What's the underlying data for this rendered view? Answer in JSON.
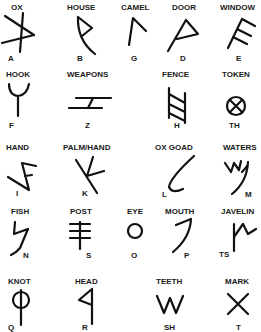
{
  "rows": [
    [
      {
        "meaning": "OX",
        "letter": "A"
      },
      {
        "meaning": "HOUSE",
        "letter": "B"
      },
      {
        "meaning": "CAMEL",
        "letter": "G"
      },
      {
        "meaning": "DOOR",
        "letter": "D"
      },
      {
        "meaning": "WINDOW",
        "letter": "E"
      }
    ],
    [
      {
        "meaning": "HOOK",
        "letter": "F"
      },
      {
        "meaning": "WEAPONS",
        "letter": "Z"
      },
      {
        "meaning": "FENCE",
        "letter": "H"
      },
      {
        "meaning": "TOKEN",
        "letter": "TH"
      }
    ],
    [
      {
        "meaning": "HAND",
        "letter": "I"
      },
      {
        "meaning": "PALM/HAND",
        "letter": "K"
      },
      {
        "meaning": "OX GOAD",
        "letter": "L"
      },
      {
        "meaning": "WATERS",
        "letter": "M"
      }
    ],
    [
      {
        "meaning": "FISH",
        "letter": "N"
      },
      {
        "meaning": "POST",
        "letter": "S"
      },
      {
        "meaning": "EYE",
        "letter": "O"
      },
      {
        "meaning": "MOUTH",
        "letter": "P"
      },
      {
        "meaning": "JAVELIN",
        "letter": "TS"
      }
    ],
    [
      {
        "meaning": "KNOT",
        "letter": "Q"
      },
      {
        "meaning": "HEAD",
        "letter": "R"
      },
      {
        "meaning": "TEETH",
        "letter": "SH"
      },
      {
        "meaning": "MARK",
        "letter": "T"
      }
    ]
  ]
}
